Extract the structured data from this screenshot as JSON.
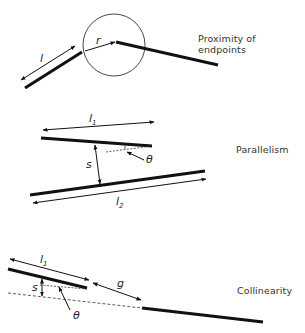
{
  "diagram": {
    "panels": [
      {
        "title": "Proximity of endpoints",
        "symbols": {
          "length": "l",
          "radius": "r"
        }
      },
      {
        "title": "Parallelism",
        "symbols": {
          "length1": "l",
          "length1_sub": "1",
          "separation": "s",
          "angle": "θ",
          "length2": "l",
          "length2_sub": "2"
        }
      },
      {
        "title": "Collinearity",
        "symbols": {
          "length1": "l",
          "length1_sub": "1",
          "gap": "g",
          "separation": "s",
          "angle": "θ"
        }
      }
    ]
  }
}
